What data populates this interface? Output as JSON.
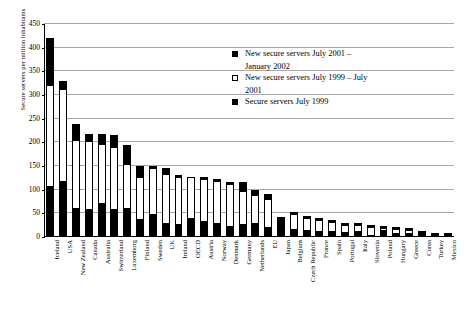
{
  "chart_data": {
    "type": "bar",
    "title": "",
    "subtitle": "",
    "xlabel": "",
    "ylabel": "Secure servers per million inhabitants",
    "ylim": [
      0,
      450
    ],
    "ytick_step": 50,
    "yticks": [
      0,
      50,
      100,
      150,
      200,
      250,
      300,
      350,
      400,
      450
    ],
    "ytick_labels": [
      "0",
      "50",
      "100",
      "150",
      "200",
      "250",
      "300",
      "350",
      "400",
      "450"
    ],
    "grid": true,
    "stacked": true,
    "legend_position": "inside-upper-right",
    "legend": [
      {
        "label": "New secure servers July 2001 – January 2002",
        "line1": "New secure servers July 2001 –",
        "line2": "January 2002",
        "swatch": "dark"
      },
      {
        "label": "New secure servers July 1999 – July 2001",
        "line1": "New secure servers July 1999 – July",
        "line2": "2001",
        "swatch": "light"
      },
      {
        "label": "Secure servers July 1999",
        "line1": "Secure servers July 1999",
        "line2": "",
        "swatch": "dark"
      }
    ],
    "categories": [
      "Iceland",
      "USA",
      "New Zealand",
      "Canada",
      "Australia",
      "Switzerland",
      "Luxemborg",
      "Finland",
      "Sweden",
      "UK",
      "Ireland",
      "OECD",
      "Austria",
      "Norway",
      "Denmark",
      "Germany",
      "Netherlands",
      "EU",
      "Japan",
      "Belgium",
      "Czech Republic",
      "France",
      "Spain",
      "Portugal",
      "Italy",
      "Slovenia",
      "Poland",
      "Hungary",
      "Greece",
      "Corea",
      "Turkey",
      "Mexico"
    ],
    "series": [
      {
        "name": "Secure servers July 1999",
        "swatch": "dark",
        "values": [
          105,
          117,
          60,
          58,
          70,
          57,
          60,
          35,
          46,
          28,
          26,
          38,
          31,
          28,
          21,
          25,
          27,
          18,
          42,
          15,
          12,
          10,
          11,
          8,
          10,
          3,
          13,
          6,
          6,
          4,
          2,
          2
        ]
      },
      {
        "name": "New secure servers July 1999 – July 2001",
        "swatch": "light",
        "values": [
          217,
          195,
          145,
          145,
          126,
          133,
          95,
          92,
          99,
          105,
          101,
          88,
          92,
          90,
          92,
          72,
          61,
          63,
          0,
          33,
          28,
          25,
          20,
          18,
          16,
          18,
          6,
          11,
          8,
          5,
          2,
          2
        ]
      },
      {
        "name": "New secure servers July 2001 – January 2002",
        "swatch": "dark",
        "values": [
          98,
          18,
          33,
          15,
          22,
          25,
          39,
          24,
          2,
          12,
          1,
          0,
          1,
          1,
          3,
          20,
          11,
          9,
          0,
          4,
          4,
          4,
          3,
          4,
          4,
          1,
          5,
          2,
          2,
          2,
          1,
          1
        ]
      }
    ],
    "totals": [
      420,
      330,
      238,
      218,
      218,
      215,
      194,
      151,
      147,
      145,
      128,
      126,
      124,
      119,
      116,
      117,
      99,
      90,
      42,
      52,
      44,
      39,
      34,
      30,
      30,
      22,
      24,
      19,
      16,
      11,
      5,
      5
    ]
  }
}
